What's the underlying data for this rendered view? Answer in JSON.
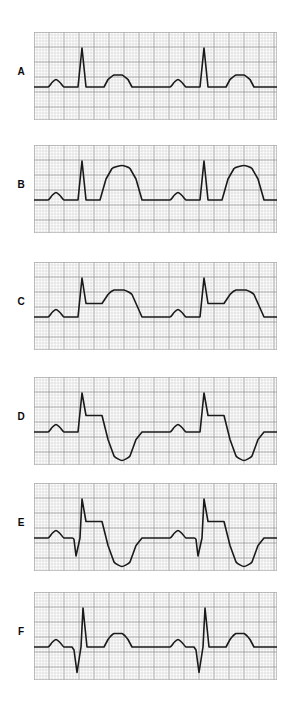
{
  "figure": {
    "title": "",
    "background_color": "#ffffff",
    "panel_count": 6,
    "grid": {
      "minor_color": "#c8c8c8",
      "major_color": "#9a9a9a",
      "minor_step_px": 3,
      "major_every": 5,
      "border_color": "#b0b0b0"
    },
    "trace": {
      "color": "#1a1a1a",
      "width_px": 1.6
    },
    "panel_geometry": {
      "left_px": 34,
      "width_px": 243,
      "height_px": 88,
      "label_left_px": 10
    }
  },
  "chart_data": {
    "type": "line",
    "xlabel": "Time",
    "ylabel": "Amplitude",
    "grid": true,
    "legend": "none",
    "x_unit": "small square = 0.04 s",
    "y_unit": "small square = 0.1 mV",
    "baseline_mv": 0,
    "series": [
      {
        "name": "A",
        "label": "A",
        "description": "Normal sinus complex: small rounded P wave, narrow tall R spike, isoelectric ST segment, low rounded upright T wave.",
        "features": {
          "p_wave": "upright low rounded",
          "q_wave": "absent",
          "r_wave": "tall narrow",
          "st_segment": "isoelectric",
          "t_wave": "upright low rounded"
        },
        "points": [
          [
            0,
            0
          ],
          [
            14,
            0
          ],
          [
            18,
            3
          ],
          [
            22,
            5
          ],
          [
            26,
            3
          ],
          [
            30,
            0
          ],
          [
            40,
            0
          ],
          [
            44,
            0
          ],
          [
            48,
            26
          ],
          [
            52,
            0
          ],
          [
            56,
            0
          ],
          [
            70,
            0
          ],
          [
            74,
            5
          ],
          [
            80,
            8
          ],
          [
            88,
            8
          ],
          [
            94,
            5
          ],
          [
            98,
            0
          ],
          [
            122,
            0
          ],
          [
            122,
            0
          ],
          [
            136,
            0
          ],
          [
            140,
            3
          ],
          [
            144,
            5
          ],
          [
            148,
            3
          ],
          [
            152,
            0
          ],
          [
            162,
            0
          ],
          [
            166,
            0
          ],
          [
            170,
            26
          ],
          [
            174,
            0
          ],
          [
            178,
            0
          ],
          [
            192,
            0
          ],
          [
            196,
            5
          ],
          [
            202,
            8
          ],
          [
            210,
            8
          ],
          [
            216,
            5
          ],
          [
            220,
            0
          ],
          [
            243,
            0
          ]
        ]
      },
      {
        "name": "B",
        "label": "B",
        "description": "Hyperacute T waves: P wave normal, tall narrow R, ST joins a very tall and broad symmetric T wave.",
        "features": {
          "p_wave": "upright low rounded",
          "q_wave": "absent",
          "r_wave": "tall narrow",
          "st_segment": "isoelectric, short",
          "t_wave": "very tall broad hyperacute"
        },
        "points": [
          [
            0,
            0
          ],
          [
            14,
            0
          ],
          [
            18,
            3
          ],
          [
            22,
            5
          ],
          [
            26,
            3
          ],
          [
            30,
            0
          ],
          [
            40,
            0
          ],
          [
            44,
            0
          ],
          [
            48,
            26
          ],
          [
            52,
            0
          ],
          [
            58,
            0
          ],
          [
            66,
            0
          ],
          [
            72,
            14
          ],
          [
            78,
            21
          ],
          [
            88,
            23
          ],
          [
            96,
            21
          ],
          [
            102,
            14
          ],
          [
            108,
            0
          ],
          [
            122,
            0
          ],
          [
            136,
            0
          ],
          [
            140,
            3
          ],
          [
            144,
            5
          ],
          [
            148,
            3
          ],
          [
            152,
            0
          ],
          [
            162,
            0
          ],
          [
            166,
            0
          ],
          [
            170,
            26
          ],
          [
            174,
            0
          ],
          [
            180,
            0
          ],
          [
            188,
            0
          ],
          [
            194,
            14
          ],
          [
            200,
            21
          ],
          [
            210,
            23
          ],
          [
            218,
            21
          ],
          [
            224,
            14
          ],
          [
            230,
            0
          ],
          [
            243,
            0
          ]
        ]
      },
      {
        "name": "C",
        "label": "C",
        "description": "ST-segment elevation: R spike followed by an elevated horizontal ST plateau that rises into a broad upright T wave.",
        "features": {
          "p_wave": "upright low rounded",
          "q_wave": "absent",
          "r_wave": "tall narrow",
          "st_segment": "elevated plateau",
          "t_wave": "broad upright, merges with ST"
        },
        "points": [
          [
            0,
            0
          ],
          [
            14,
            0
          ],
          [
            18,
            3
          ],
          [
            22,
            5
          ],
          [
            26,
            3
          ],
          [
            30,
            0
          ],
          [
            40,
            0
          ],
          [
            44,
            0
          ],
          [
            48,
            26
          ],
          [
            52,
            9
          ],
          [
            60,
            9
          ],
          [
            68,
            9
          ],
          [
            74,
            15
          ],
          [
            80,
            18
          ],
          [
            90,
            18
          ],
          [
            98,
            15
          ],
          [
            104,
            6
          ],
          [
            108,
            0
          ],
          [
            122,
            0
          ],
          [
            136,
            0
          ],
          [
            140,
            3
          ],
          [
            144,
            5
          ],
          [
            148,
            3
          ],
          [
            152,
            0
          ],
          [
            162,
            0
          ],
          [
            166,
            0
          ],
          [
            170,
            26
          ],
          [
            174,
            9
          ],
          [
            182,
            9
          ],
          [
            190,
            9
          ],
          [
            196,
            15
          ],
          [
            202,
            18
          ],
          [
            212,
            18
          ],
          [
            220,
            15
          ],
          [
            226,
            6
          ],
          [
            230,
            0
          ],
          [
            243,
            0
          ]
        ]
      },
      {
        "name": "D",
        "label": "D",
        "description": "ST elevation with T-wave inversion: elevated ST plateau descends steeply below the baseline into a deep inverted T wave.",
        "features": {
          "p_wave": "upright low rounded",
          "q_wave": "absent",
          "r_wave": "tall narrow",
          "st_segment": "elevated plateau",
          "t_wave": "deeply inverted"
        },
        "points": [
          [
            0,
            0
          ],
          [
            14,
            0
          ],
          [
            18,
            3
          ],
          [
            22,
            5
          ],
          [
            26,
            3
          ],
          [
            30,
            0
          ],
          [
            40,
            0
          ],
          [
            44,
            0
          ],
          [
            48,
            26
          ],
          [
            52,
            11
          ],
          [
            62,
            11
          ],
          [
            68,
            11
          ],
          [
            74,
            -5
          ],
          [
            80,
            -16
          ],
          [
            88,
            -19
          ],
          [
            96,
            -16
          ],
          [
            102,
            -5
          ],
          [
            108,
            0
          ],
          [
            122,
            0
          ],
          [
            136,
            0
          ],
          [
            140,
            3
          ],
          [
            144,
            5
          ],
          [
            148,
            3
          ],
          [
            152,
            0
          ],
          [
            162,
            0
          ],
          [
            166,
            0
          ],
          [
            170,
            26
          ],
          [
            174,
            11
          ],
          [
            184,
            11
          ],
          [
            190,
            11
          ],
          [
            196,
            -5
          ],
          [
            202,
            -16
          ],
          [
            210,
            -19
          ],
          [
            218,
            -16
          ],
          [
            224,
            -5
          ],
          [
            230,
            0
          ],
          [
            243,
            0
          ]
        ]
      },
      {
        "name": "E",
        "label": "E",
        "description": "Pathological Q wave with ST elevation and inverted T wave: deep narrow Q precedes the R spike, ST plateau elevated, T deeply inverted.",
        "features": {
          "p_wave": "upright low rounded",
          "q_wave": "deep narrow pathological",
          "r_wave": "tall narrow",
          "st_segment": "elevated plateau",
          "t_wave": "deeply inverted"
        },
        "points": [
          [
            0,
            0
          ],
          [
            14,
            0
          ],
          [
            18,
            3
          ],
          [
            22,
            5
          ],
          [
            26,
            3
          ],
          [
            30,
            0
          ],
          [
            38,
            0
          ],
          [
            40,
            -1
          ],
          [
            42,
            -12
          ],
          [
            46,
            0
          ],
          [
            48,
            26
          ],
          [
            52,
            11
          ],
          [
            62,
            11
          ],
          [
            68,
            11
          ],
          [
            74,
            -5
          ],
          [
            80,
            -16
          ],
          [
            88,
            -19
          ],
          [
            96,
            -16
          ],
          [
            102,
            -5
          ],
          [
            108,
            0
          ],
          [
            122,
            0
          ],
          [
            136,
            0
          ],
          [
            140,
            3
          ],
          [
            144,
            5
          ],
          [
            148,
            3
          ],
          [
            152,
            0
          ],
          [
            160,
            0
          ],
          [
            162,
            -1
          ],
          [
            164,
            -12
          ],
          [
            168,
            0
          ],
          [
            170,
            26
          ],
          [
            174,
            11
          ],
          [
            184,
            11
          ],
          [
            190,
            11
          ],
          [
            196,
            -5
          ],
          [
            202,
            -16
          ],
          [
            210,
            -19
          ],
          [
            218,
            -16
          ],
          [
            224,
            -5
          ],
          [
            230,
            0
          ],
          [
            243,
            0
          ]
        ]
      },
      {
        "name": "F",
        "label": "F",
        "description": "Resolved pattern with residual deep Q wave: deep narrow Q, tall R, isoelectric ST, and a restored upright rounded T wave.",
        "features": {
          "p_wave": "upright low rounded",
          "q_wave": "deep narrow pathological",
          "r_wave": "tall narrow",
          "st_segment": "isoelectric",
          "t_wave": "upright rounded, normal"
        },
        "points": [
          [
            0,
            0
          ],
          [
            14,
            0
          ],
          [
            18,
            3
          ],
          [
            22,
            5
          ],
          [
            26,
            3
          ],
          [
            30,
            0
          ],
          [
            38,
            0
          ],
          [
            40,
            -2
          ],
          [
            43,
            -17
          ],
          [
            47,
            0
          ],
          [
            49,
            26
          ],
          [
            53,
            0
          ],
          [
            58,
            0
          ],
          [
            70,
            0
          ],
          [
            74,
            5
          ],
          [
            80,
            9
          ],
          [
            88,
            9
          ],
          [
            94,
            5
          ],
          [
            98,
            0
          ],
          [
            122,
            0
          ],
          [
            136,
            0
          ],
          [
            140,
            3
          ],
          [
            144,
            5
          ],
          [
            148,
            3
          ],
          [
            152,
            0
          ],
          [
            160,
            0
          ],
          [
            162,
            -2
          ],
          [
            165,
            -17
          ],
          [
            169,
            0
          ],
          [
            171,
            26
          ],
          [
            175,
            0
          ],
          [
            180,
            0
          ],
          [
            192,
            0
          ],
          [
            196,
            5
          ],
          [
            202,
            9
          ],
          [
            210,
            9
          ],
          [
            216,
            5
          ],
          [
            220,
            0
          ],
          [
            243,
            0
          ]
        ]
      }
    ]
  },
  "panels": [
    {
      "label": "A",
      "top_px": 32,
      "label_top_px": 66
    },
    {
      "label": "B",
      "top_px": 145,
      "label_top_px": 179
    },
    {
      "label": "C",
      "top_px": 262,
      "label_top_px": 296
    },
    {
      "label": "D",
      "top_px": 377,
      "label_top_px": 411
    },
    {
      "label": "E",
      "top_px": 483,
      "label_top_px": 517
    },
    {
      "label": "F",
      "top_px": 592,
      "label_top_px": 626
    }
  ]
}
